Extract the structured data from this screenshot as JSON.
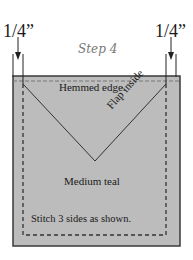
{
  "diagram": {
    "step_label": "Step 4",
    "dimension_left": "1/4”",
    "dimension_right": "1/4”",
    "labels": {
      "hemmed_edge": "Hemmed edge.",
      "flap_inside": "Flap inside",
      "fabric_color": "Medium teal",
      "instruction": "Stitch 3 sides as shown."
    },
    "colors": {
      "fabric": "#bcbcbc",
      "outline": "#3a3a3a",
      "stitch": "#333333"
    }
  }
}
